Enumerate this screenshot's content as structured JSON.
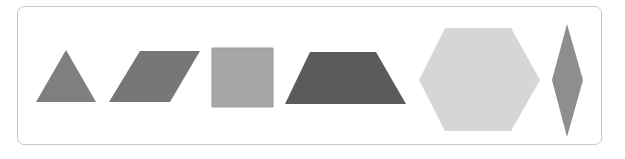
{
  "figure": {
    "shapes": [
      {
        "name": "triangle",
        "points": "66,50 96,102 36,102",
        "fill": "#7f7f7f"
      },
      {
        "name": "parallelogram",
        "points": "140,51 200,51 170,102 109,102",
        "fill": "#777777"
      },
      {
        "name": "square",
        "points": "212,48 273,48 273,107 212,107",
        "fill": "#a6a6a6",
        "stroke": "#9a9a9a"
      },
      {
        "name": "trapezoid",
        "points": "310,52 376,52 406,104 285,104",
        "fill": "#5b5b5b"
      },
      {
        "name": "hexagon",
        "points": "445,28 511,28 540,80 511,131 445,131 419,80",
        "fill": "#d6d6d6"
      },
      {
        "name": "rhombus",
        "points": "567,24 583,80 567,137 552,80",
        "fill": "#8e8e8e"
      }
    ]
  }
}
